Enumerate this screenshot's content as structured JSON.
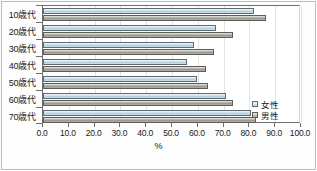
{
  "chart_data": {
    "type": "bar",
    "orientation": "horizontal",
    "title": "",
    "xlabel": "%",
    "ylabel": "",
    "categories": [
      "10歳代",
      "20歳代",
      "30歳代",
      "40歳代",
      "50歳代",
      "60歳代",
      "70歳代"
    ],
    "series": [
      {
        "name": "女性",
        "color": "#bcd9e7",
        "values": [
          81.8,
          67.2,
          58.4,
          55.7,
          59.8,
          71.0,
          80.6
        ]
      },
      {
        "name": "男性",
        "color": "#a6a69e",
        "values": [
          86.4,
          73.8,
          66.2,
          63.2,
          64.0,
          73.6,
          82.6
        ]
      }
    ],
    "xlim": [
      0.0,
      100.0
    ],
    "xticks": [
      "0.0",
      "10.0",
      "20.0",
      "30.0",
      "40.0",
      "50.0",
      "60.0",
      "70.0",
      "80.0",
      "90.0",
      "100.0"
    ],
    "xtick_values": [
      0,
      10,
      20,
      30,
      40,
      50,
      60,
      70,
      80,
      90,
      100
    ],
    "grid": true,
    "legend_position": "right-inside-bottom"
  },
  "legend": {
    "entries": [
      {
        "label": "女性",
        "swatch": "female-swatch-icon"
      },
      {
        "label": "男性",
        "swatch": "male-swatch-icon"
      }
    ]
  }
}
